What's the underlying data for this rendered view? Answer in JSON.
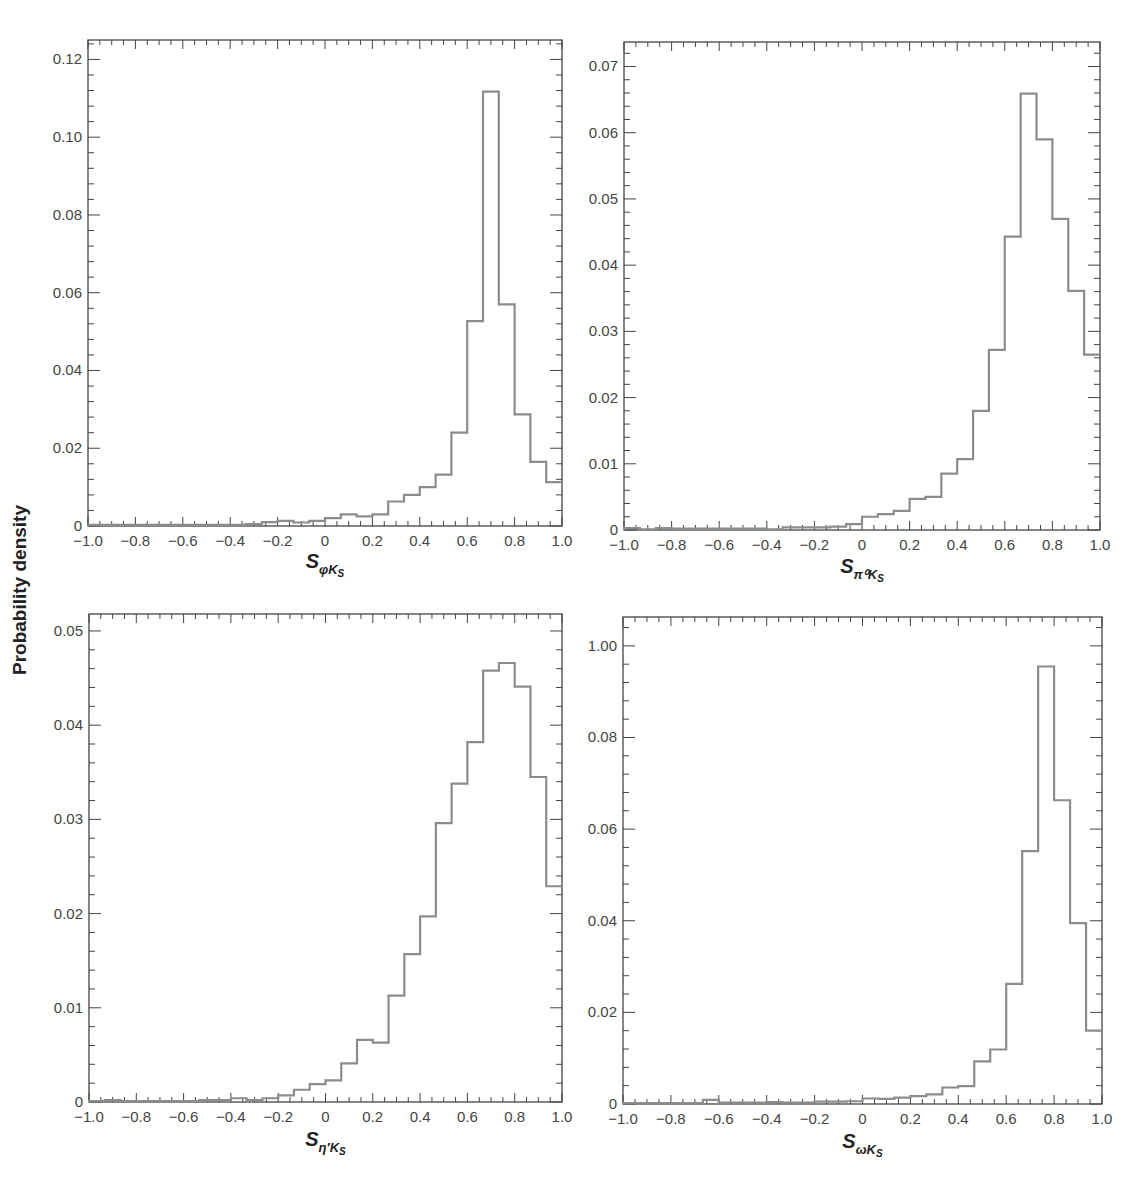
{
  "figure": {
    "ylabel": "Probability density"
  },
  "chart_data": [
    {
      "type": "histogram",
      "id": "phiKs",
      "title": "",
      "xlabel_main": "S",
      "xlabel_sub": "φK",
      "xlabel_subsub": "S",
      "xlabel": "S_{φK_S}",
      "ylabel": "Probability density",
      "xlim": [
        -1.0,
        1.0
      ],
      "ylim": [
        0,
        0.125
      ],
      "xticks": [
        "-1.0",
        "-0.8",
        "-0.6",
        "-0.4",
        "-0.2",
        "0",
        "0.2",
        "0.4",
        "0.6",
        "0.8",
        "1.0"
      ],
      "yticks": [
        {
          "v": 0,
          "label": "0"
        },
        {
          "v": 0.02,
          "label": "0.02"
        },
        {
          "v": 0.04,
          "label": "0.04"
        },
        {
          "v": 0.06,
          "label": "0.06"
        },
        {
          "v": 0.08,
          "label": "0.08"
        },
        {
          "v": 0.1,
          "label": "0.10"
        },
        {
          "v": 0.12,
          "label": "0.12"
        }
      ],
      "bin_edges_start": -1.0,
      "bin_width": 0.0667,
      "values": [
        0.0003,
        0.0003,
        0.0003,
        0.0003,
        0.0003,
        0.0003,
        0.0003,
        0.0003,
        0.0003,
        0.0003,
        0.0005,
        0.001,
        0.0013,
        0.0009,
        0.0013,
        0.002,
        0.003,
        0.0025,
        0.003,
        0.0063,
        0.008,
        0.01,
        0.0132,
        0.024,
        0.0527,
        0.1117,
        0.057,
        0.0287,
        0.0165,
        0.0113
      ],
      "grid": false,
      "legend": null
    },
    {
      "type": "histogram",
      "id": "pi0Ks",
      "title": "",
      "xlabel_main": "S",
      "xlabel_sub": "π⁰K",
      "xlabel_subsub": "S",
      "xlabel": "S_{π⁰K_S}",
      "ylabel": "Probability density",
      "xlim": [
        -1.0,
        1.0
      ],
      "ylim": [
        0,
        0.0737
      ],
      "xticks": [
        "-1.0",
        "-0.8",
        "-0.6",
        "-0.4",
        "-0.2",
        "0",
        "0.2",
        "0.4",
        "0.6",
        "0.8",
        "1.0"
      ],
      "yticks": [
        {
          "v": 0,
          "label": "0"
        },
        {
          "v": 0.01,
          "label": "0.01"
        },
        {
          "v": 0.02,
          "label": "0.02"
        },
        {
          "v": 0.03,
          "label": "0.03"
        },
        {
          "v": 0.04,
          "label": "0.04"
        },
        {
          "v": 0.05,
          "label": "0.05"
        },
        {
          "v": 0.06,
          "label": "0.06"
        },
        {
          "v": 0.07,
          "label": "0.07"
        }
      ],
      "bin_edges_start": -1.0,
      "bin_width": 0.0667,
      "values": [
        0.0003,
        0.0001,
        0.0003,
        0.0002,
        0.0002,
        0.0002,
        0.0002,
        0.0002,
        0.0002,
        0.0001,
        0.0004,
        0.0004,
        0.0004,
        0.0005,
        0.0009,
        0.002,
        0.0024,
        0.0029,
        0.0047,
        0.005,
        0.0085,
        0.0107,
        0.018,
        0.0272,
        0.0443,
        0.0659,
        0.059,
        0.047,
        0.0361,
        0.0265
      ],
      "grid": false,
      "legend": null
    },
    {
      "type": "histogram",
      "id": "etapKs",
      "title": "",
      "xlabel_main": "S",
      "xlabel_sub": "η′K",
      "xlabel_subsub": "S",
      "xlabel": "S_{η′K_S}",
      "ylabel": "Probability density",
      "xlim": [
        -1.0,
        1.0
      ],
      "ylim": [
        0,
        0.0518
      ],
      "xticks": [
        "-1.0",
        "-0.8",
        "-0.6",
        "-0.4",
        "-0.2",
        "0",
        "0.2",
        "0.4",
        "0.6",
        "0.8",
        "1.0"
      ],
      "yticks": [
        {
          "v": 0,
          "label": "0"
        },
        {
          "v": 0.01,
          "label": "0.01"
        },
        {
          "v": 0.02,
          "label": "0.02"
        },
        {
          "v": 0.03,
          "label": "0.03"
        },
        {
          "v": 0.04,
          "label": "0.04"
        },
        {
          "v": 0.05,
          "label": "0.05"
        }
      ],
      "bin_edges_start": -1.0,
      "bin_width": 0.0667,
      "values": [
        0.0001,
        0.0002,
        0.0001,
        0.0001,
        0.0001,
        0.0001,
        0.0001,
        0.0002,
        0.0002,
        0.0004,
        0.0002,
        0.0004,
        0.0007,
        0.0013,
        0.0019,
        0.0023,
        0.0041,
        0.0066,
        0.0063,
        0.0113,
        0.0157,
        0.0197,
        0.0296,
        0.0338,
        0.0382,
        0.0458,
        0.0466,
        0.0441,
        0.0345,
        0.0229
      ],
      "grid": false,
      "legend": null
    },
    {
      "type": "histogram",
      "id": "omegaKs",
      "title": "",
      "xlabel_main": "S",
      "xlabel_sub": "ωK",
      "xlabel_subsub": "S",
      "xlabel": "S_{ωK_S}",
      "ylabel": "Probability density",
      "xlim": [
        -1.0,
        1.0
      ],
      "ylim": [
        0,
        0.1063
      ],
      "xticks": [
        "-1.0",
        "-0.8",
        "-0.6",
        "-0.4",
        "-0.2",
        "0",
        "0.2",
        "0.4",
        "0.6",
        "0.8",
        "1.0"
      ],
      "yticks": [
        {
          "v": 0,
          "label": "0"
        },
        {
          "v": 0.02,
          "label": "0.02"
        },
        {
          "v": 0.04,
          "label": "0.04"
        },
        {
          "v": 0.06,
          "label": "0.06"
        },
        {
          "v": 0.08,
          "label": "0.08"
        },
        {
          "v": 0.1,
          "label": "1.00"
        }
      ],
      "bin_edges_start": -1.0,
      "bin_width": 0.0667,
      "values": [
        0.0002,
        0.0002,
        0.0002,
        0.0002,
        0.0002,
        0.0009,
        0.0003,
        0.0003,
        0.0003,
        0.0004,
        0.0003,
        0.0003,
        0.0005,
        0.0005,
        0.0006,
        0.0012,
        0.0011,
        0.0014,
        0.0017,
        0.0021,
        0.0036,
        0.0039,
        0.0093,
        0.0119,
        0.0262,
        0.0552,
        0.0955,
        0.0663,
        0.0395,
        0.024
      ]
    }
  ],
  "panels_note_values_tail": [
    0.016
  ]
}
